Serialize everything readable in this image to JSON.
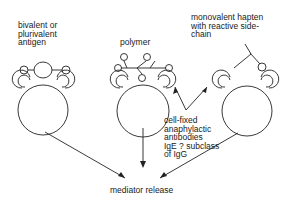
{
  "labels": {
    "antigen": "bivalent or\nplurivalent\nantigen",
    "polymer": "polymer",
    "hapten": "monovalent hapten\nwith reactive side-\nchain",
    "antibodies": "cell-fixed\nanaphylactic\nantibodies\nIgE ? subclass\nof IgG",
    "mediator": "mediator release"
  },
  "colors": {
    "line": "#222222",
    "text": "#1a1a1a",
    "background": "#ffffff"
  }
}
